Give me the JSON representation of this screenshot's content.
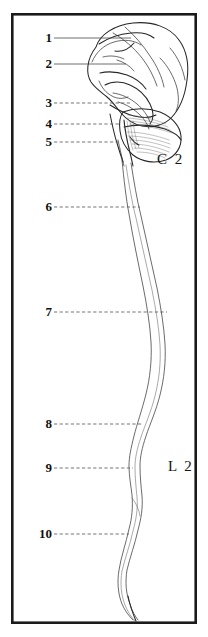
{
  "figure": {
    "background_color": "#ffffff",
    "frame_color": "#1b1b1b",
    "ink_color": "#3a3a3a"
  },
  "labels": [
    {
      "id": "1",
      "text": "1",
      "x": 38,
      "y": 32,
      "leader_from_x": 54,
      "leader_to_x": 131,
      "leader_y": 38,
      "style": "solid"
    },
    {
      "id": "2",
      "text": "2",
      "x": 38,
      "y": 58,
      "leader_from_x": 54,
      "leader_to_x": 126,
      "leader_y": 64,
      "style": "solid"
    },
    {
      "id": "3",
      "text": "3",
      "x": 38,
      "y": 97,
      "leader_from_x": 54,
      "leader_to_x": 130,
      "leader_y": 103,
      "style": "dashed"
    },
    {
      "id": "4",
      "text": "4",
      "x": 38,
      "y": 118,
      "leader_from_x": 54,
      "leader_to_x": 121,
      "leader_y": 124,
      "style": "dashed"
    },
    {
      "id": "5",
      "text": "5",
      "x": 38,
      "y": 136,
      "leader_from_x": 54,
      "leader_to_x": 120,
      "leader_y": 142,
      "style": "dashed"
    },
    {
      "id": "6",
      "text": "6",
      "x": 38,
      "y": 201,
      "leader_from_x": 54,
      "leader_to_x": 140,
      "leader_y": 207,
      "style": "dashed"
    },
    {
      "id": "7",
      "text": "7",
      "x": 38,
      "y": 306,
      "leader_from_x": 54,
      "leader_to_x": 167,
      "leader_y": 312,
      "style": "dashed"
    },
    {
      "id": "8",
      "text": "8",
      "x": 38,
      "y": 418,
      "leader_from_x": 54,
      "leader_to_x": 142,
      "leader_y": 424,
      "style": "dashed"
    },
    {
      "id": "9",
      "text": "9",
      "x": 38,
      "y": 462,
      "leader_from_x": 54,
      "leader_to_x": 133,
      "leader_y": 468,
      "style": "dashed"
    },
    {
      "id": "10",
      "text": "10",
      "x": 30,
      "y": 528,
      "leader_from_x": 54,
      "leader_to_x": 129,
      "leader_y": 534,
      "style": "dashed"
    }
  ],
  "level_markers": [
    {
      "id": "c2",
      "text": "C 2",
      "x": 157,
      "y": 153
    },
    {
      "id": "l2",
      "text": "L 2",
      "x": 168,
      "y": 460
    }
  ],
  "frame": {
    "x": 11,
    "y": 13,
    "width": 186,
    "height": 611
  }
}
